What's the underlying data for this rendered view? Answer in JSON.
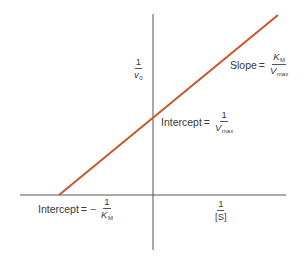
{
  "diagram": {
    "colors": {
      "line": "#c8562b",
      "axis": "#555555",
      "text": "#3a3a3a",
      "background": "#ffffff"
    },
    "y_axis": {
      "label_num": "1",
      "label_den": "v",
      "label_den_sub": "0"
    },
    "x_axis": {
      "label_num": "1",
      "label_den": "[S]"
    },
    "slope_label": {
      "prefix": "Slope",
      "eq": "=",
      "num": "K",
      "num_sub": "M",
      "den": "V",
      "den_sub": "max"
    },
    "y_intercept_label": {
      "prefix": "Intercept",
      "eq": "=",
      "num": "1",
      "den": "V",
      "den_sub": "max"
    },
    "x_intercept_label": {
      "prefix": "Intercept",
      "eq": "= −",
      "num": "1",
      "den": "K",
      "den_sub": "M"
    }
  }
}
